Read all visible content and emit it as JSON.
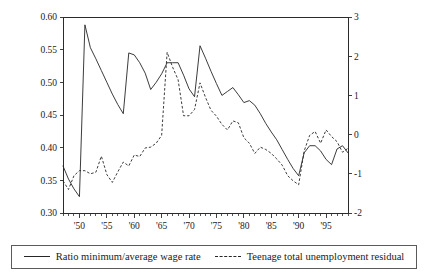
{
  "chart_data": {
    "type": "line",
    "title": "",
    "subtitle": "",
    "xlabel": "",
    "ylabel": "",
    "ylabel_right": "",
    "grid": false,
    "legend_position": "bottom",
    "xlim": [
      1947,
      1999
    ],
    "ylim": [
      0.3,
      0.6
    ],
    "ylim_right": [
      -2,
      3
    ],
    "xticks": [
      1950,
      1955,
      1960,
      1965,
      1970,
      1975,
      1980,
      1985,
      1990,
      1995
    ],
    "xticklabels": [
      "'50",
      "'55",
      "'60",
      "'65",
      "'70",
      "'75",
      "'80",
      "'85",
      "'90",
      "'95"
    ],
    "xtick_minor_step": 1,
    "yticks_left": [
      0.3,
      0.35,
      0.4,
      0.45,
      0.5,
      0.55,
      0.6
    ],
    "yticklabels_left": [
      "0.30",
      "0.35",
      "0.40",
      "0.45",
      "0.50",
      "0.55",
      "0.60"
    ],
    "yticks_right": [
      -2,
      -1,
      0,
      1,
      2,
      3
    ],
    "yticklabels_right": [
      "-2",
      "-1",
      "0",
      "1",
      "2",
      "3"
    ],
    "series": [
      {
        "name": "Ratio minimum/average wage rate",
        "style": "solid",
        "axis": "left",
        "x": [
          1947,
          1948,
          1949,
          1950,
          1951,
          1952,
          1953,
          1954,
          1955,
          1956,
          1957,
          1958,
          1959,
          1960,
          1961,
          1962,
          1963,
          1964,
          1965,
          1966,
          1967,
          1968,
          1969,
          1970,
          1971,
          1972,
          1973,
          1974,
          1975,
          1976,
          1977,
          1978,
          1979,
          1980,
          1981,
          1982,
          1983,
          1984,
          1985,
          1986,
          1987,
          1988,
          1989,
          1990,
          1991,
          1992,
          1993,
          1994,
          1995,
          1996,
          1997,
          1998,
          1999
        ],
        "values": [
          0.372,
          0.352,
          0.337,
          0.325,
          0.588,
          0.553,
          0.536,
          0.518,
          0.5,
          0.482,
          0.466,
          0.452,
          0.545,
          0.542,
          0.53,
          0.514,
          0.489,
          0.5,
          0.513,
          0.53,
          0.53,
          0.53,
          0.511,
          0.49,
          0.478,
          0.556,
          0.537,
          0.517,
          0.498,
          0.48,
          0.486,
          0.492,
          0.481,
          0.469,
          0.472,
          0.465,
          0.452,
          0.437,
          0.424,
          0.412,
          0.397,
          0.382,
          0.368,
          0.357,
          0.392,
          0.403,
          0.403,
          0.395,
          0.382,
          0.374,
          0.398,
          0.403,
          0.392
        ]
      },
      {
        "name": "Teenage total unemployment residual",
        "style": "dashed",
        "axis": "right",
        "x": [
          1947,
          1948,
          1949,
          1950,
          1951,
          1952,
          1953,
          1954,
          1955,
          1956,
          1957,
          1958,
          1959,
          1960,
          1961,
          1962,
          1963,
          1964,
          1965,
          1966,
          1967,
          1968,
          1969,
          1970,
          1971,
          1972,
          1973,
          1974,
          1975,
          1976,
          1977,
          1978,
          1979,
          1980,
          1981,
          1982,
          1983,
          1984,
          1985,
          1986,
          1987,
          1988,
          1989,
          1990,
          1991,
          1992,
          1993,
          1994,
          1995,
          1996,
          1997,
          1998,
          1999
        ],
        "values": [
          -1.18,
          -1.4,
          -1.05,
          -0.92,
          -0.92,
          -1.0,
          -0.96,
          -0.55,
          -1.02,
          -1.22,
          -0.95,
          -0.7,
          -0.8,
          -0.52,
          -0.56,
          -0.34,
          -0.32,
          -0.22,
          -0.02,
          2.1,
          1.72,
          1.4,
          0.48,
          0.48,
          0.64,
          1.32,
          0.95,
          0.62,
          0.47,
          0.26,
          0.12,
          0.35,
          0.3,
          -0.08,
          -0.22,
          -0.48,
          -0.32,
          -0.38,
          -0.48,
          -0.62,
          -0.78,
          -1.05,
          -1.18,
          -1.28,
          -0.42,
          -0.02,
          0.08,
          -0.22,
          0.12,
          -0.05,
          -0.18,
          -0.45,
          -0.35
        ]
      }
    ]
  },
  "legend": {
    "entries": [
      {
        "label": "Ratio minimum/average wage rate",
        "style": "solid"
      },
      {
        "label": "Teenage total unemployment residual",
        "style": "dashed"
      }
    ]
  }
}
